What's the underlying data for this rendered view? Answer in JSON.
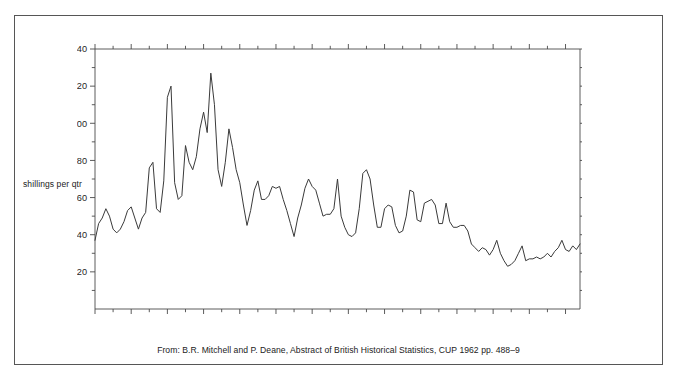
{
  "figure": {
    "caption": "From: B.R. Mitchell and P. Deane, Abstract of British Historical Statistics, CUP 1962 pp. 488–9",
    "y_axis_label": "shillings per qtr",
    "line_color": "#3a3a3a",
    "axis_color": "#4a4a4a",
    "frame_color": "#565656"
  },
  "chart_data": {
    "type": "line",
    "title": "",
    "xlabel": "",
    "ylabel": "shillings per qtr",
    "xlim": [
      1780,
      1914
    ],
    "ylim": [
      0,
      140
    ],
    "grid": false,
    "legend": false,
    "y_major_ticks": [
      20,
      40,
      60,
      80,
      100,
      120,
      140
    ],
    "y_major_tick_labels": [
      "20",
      "40",
      "60",
      "80",
      "100",
      "120",
      "140"
    ],
    "y_minor_tick_interval": 10,
    "x_major_ticks": [
      1780,
      1790,
      1800,
      1810,
      1820,
      1830,
      1840,
      1850,
      1860,
      1870,
      1880,
      1890,
      1900,
      1910
    ],
    "x_major_tick_labels": [
      "1780",
      "90",
      "1800",
      "10",
      "20",
      "30",
      "40",
      "50",
      "60",
      "70",
      "80",
      "90",
      "1900",
      "10"
    ],
    "x_minor_tick_interval": 5,
    "series": [
      {
        "name": "English wheat price",
        "x": [
          1780,
          1781,
          1782,
          1783,
          1784,
          1785,
          1786,
          1787,
          1788,
          1789,
          1790,
          1791,
          1792,
          1793,
          1794,
          1795,
          1796,
          1797,
          1798,
          1799,
          1800,
          1801,
          1802,
          1803,
          1804,
          1805,
          1806,
          1807,
          1808,
          1809,
          1810,
          1811,
          1812,
          1813,
          1814,
          1815,
          1816,
          1817,
          1818,
          1819,
          1820,
          1821,
          1822,
          1823,
          1824,
          1825,
          1826,
          1827,
          1828,
          1829,
          1830,
          1831,
          1832,
          1833,
          1834,
          1835,
          1836,
          1837,
          1838,
          1839,
          1840,
          1841,
          1842,
          1843,
          1844,
          1845,
          1846,
          1847,
          1848,
          1849,
          1850,
          1851,
          1852,
          1853,
          1854,
          1855,
          1856,
          1857,
          1858,
          1859,
          1860,
          1861,
          1862,
          1863,
          1864,
          1865,
          1866,
          1867,
          1868,
          1869,
          1870,
          1871,
          1872,
          1873,
          1874,
          1875,
          1876,
          1877,
          1878,
          1879,
          1880,
          1881,
          1882,
          1883,
          1884,
          1885,
          1886,
          1887,
          1888,
          1889,
          1890,
          1891,
          1892,
          1893,
          1894,
          1895,
          1896,
          1897,
          1898,
          1899,
          1900,
          1901,
          1902,
          1903,
          1904,
          1905,
          1906,
          1907,
          1908,
          1909,
          1910,
          1911,
          1912,
          1913,
          1914
        ],
        "values": [
          37,
          46,
          49,
          54,
          50,
          43,
          41,
          43,
          47,
          53,
          55,
          49,
          43,
          49,
          52,
          76,
          79,
          54,
          52,
          69,
          114,
          120,
          68,
          59,
          61,
          88,
          79,
          75,
          82,
          97,
          106,
          95,
          127,
          110,
          75,
          66,
          79,
          97,
          87,
          75,
          68,
          56,
          45,
          53,
          64,
          69,
          59,
          59,
          61,
          66,
          65,
          66,
          59,
          53,
          46,
          39,
          49,
          56,
          65,
          70,
          66,
          64,
          57,
          50,
          51,
          51,
          54,
          70,
          50,
          44,
          40,
          39,
          41,
          54,
          73,
          75,
          70,
          56,
          44,
          44,
          54,
          56,
          55,
          45,
          41,
          42,
          50,
          64,
          63,
          48,
          47,
          57,
          58,
          59,
          56,
          46,
          46,
          57,
          47,
          44,
          44,
          45,
          45,
          42,
          35,
          33,
          31,
          33,
          32,
          29,
          32,
          37,
          30,
          26,
          23,
          24,
          26,
          30,
          34,
          26,
          27,
          27,
          28,
          27,
          28,
          30,
          28,
          31,
          33,
          37,
          32,
          31,
          34,
          32,
          35
        ]
      }
    ]
  }
}
